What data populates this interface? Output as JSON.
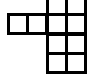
{
  "diagram": {
    "type": "grid-net",
    "line_color": "#000000",
    "background": "#ffffff",
    "cells": [
      {
        "row": 0,
        "col": 2
      },
      {
        "row": 0,
        "col": 3
      },
      {
        "row": 1,
        "col": 0
      },
      {
        "row": 1,
        "col": 1
      },
      {
        "row": 1,
        "col": 2
      },
      {
        "row": 1,
        "col": 3
      },
      {
        "row": 2,
        "col": 2
      },
      {
        "row": 2,
        "col": 3
      },
      {
        "row": 3,
        "col": 2
      },
      {
        "row": 3,
        "col": 3
      }
    ]
  }
}
